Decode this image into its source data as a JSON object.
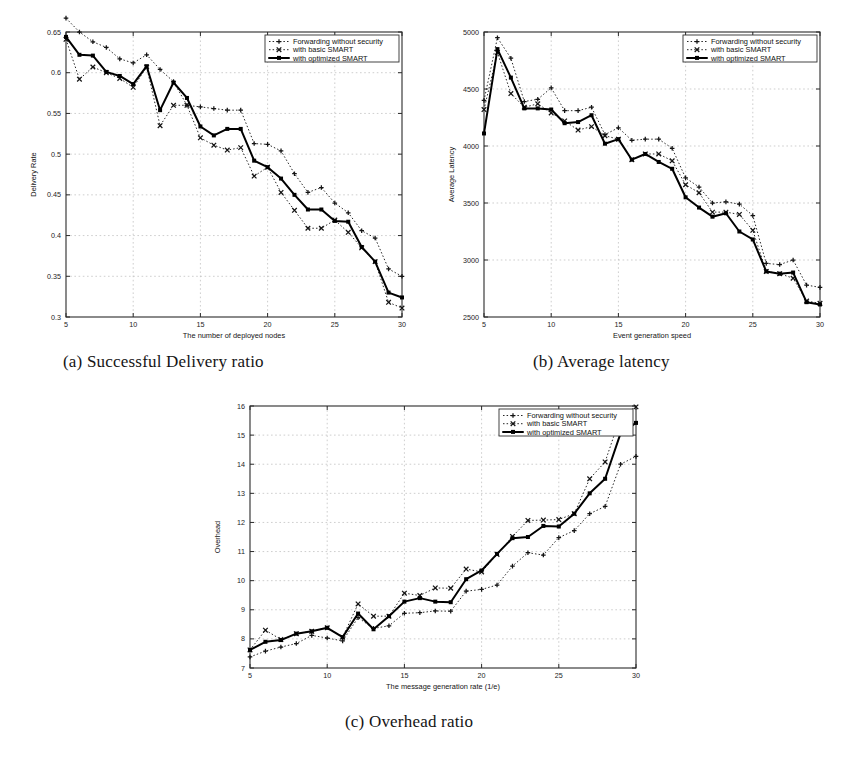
{
  "figure": {
    "background_color": "#ffffff",
    "ink_color": "#141414",
    "subcaptions": {
      "a": "(a) Successful Delivery ratio",
      "b": "(b) Average latency",
      "c": "(c) Overhead ratio"
    }
  },
  "legend": {
    "position": "top-right",
    "entries": [
      {
        "label": "Forwarding without security",
        "marker": "plus",
        "style": "dotted"
      },
      {
        "label": "with basic SMART",
        "marker": "x",
        "style": "dotted"
      },
      {
        "label": "with optimized SMART",
        "marker": "square",
        "style": "solid"
      }
    ]
  },
  "chart_data": [
    {
      "id": "a",
      "type": "line",
      "title": "",
      "xlabel": "The number of deployed nodes",
      "ylabel": "Delivery Rate",
      "xlim": [
        5,
        30
      ],
      "ylim": [
        0.3,
        0.65
      ],
      "xticks": [
        5,
        10,
        15,
        20,
        25,
        30
      ],
      "yticks": [
        0.3,
        0.35,
        0.4,
        0.45,
        0.5,
        0.55,
        0.6,
        0.65
      ],
      "ytick_labels": [
        "0.3",
        "0.35",
        "0.4",
        "0.45",
        "0.5",
        "0.55",
        "0.6",
        "0.65"
      ],
      "xtick_labels": [
        "5",
        "10",
        "15",
        "20",
        "25",
        "30"
      ],
      "grid": true,
      "legend_position": "top-right",
      "x": [
        5,
        6,
        7,
        8,
        9,
        10,
        11,
        12,
        13,
        14,
        15,
        16,
        17,
        18,
        19,
        20,
        21,
        22,
        23,
        24,
        25,
        26,
        27,
        28,
        29,
        30
      ],
      "series": [
        {
          "name": "Forwarding without security",
          "marker": "plus",
          "style": "dotted",
          "values": [
            0.667,
            0.65,
            0.638,
            0.631,
            0.617,
            0.612,
            0.622,
            0.604,
            0.589,
            0.56,
            0.558,
            0.556,
            0.554,
            0.554,
            0.513,
            0.512,
            0.504,
            0.476,
            0.453,
            0.459,
            0.44,
            0.428,
            0.406,
            0.397,
            0.359,
            0.35
          ]
        },
        {
          "name": "with basic SMART",
          "marker": "x",
          "style": "dotted",
          "values": [
            0.641,
            0.592,
            0.607,
            0.6,
            0.593,
            0.582,
            0.607,
            0.535,
            0.56,
            0.56,
            0.52,
            0.511,
            0.505,
            0.508,
            0.473,
            0.484,
            0.453,
            0.431,
            0.409,
            0.409,
            0.419,
            0.404,
            0.385,
            0.368,
            0.318,
            0.311
          ]
        },
        {
          "name": "with optimized SMART",
          "marker": "square",
          "style": "solid",
          "values": [
            0.644,
            0.622,
            0.621,
            0.601,
            0.596,
            0.586,
            0.608,
            0.554,
            0.588,
            0.569,
            0.534,
            0.523,
            0.531,
            0.531,
            0.492,
            0.484,
            0.47,
            0.45,
            0.432,
            0.432,
            0.418,
            0.417,
            0.386,
            0.368,
            0.33,
            0.324
          ]
        }
      ]
    },
    {
      "id": "b",
      "type": "line",
      "title": "",
      "xlabel": "Event generation speed",
      "ylabel": "Average Latency",
      "xlim": [
        5,
        30
      ],
      "ylim": [
        2500,
        5000
      ],
      "xticks": [
        5,
        10,
        15,
        20,
        25,
        30
      ],
      "yticks": [
        2500,
        3000,
        3500,
        4000,
        4500,
        5000
      ],
      "ytick_labels": [
        "2500",
        "3000",
        "3500",
        "4000",
        "4500",
        "5000"
      ],
      "xtick_labels": [
        "5",
        "10",
        "15",
        "20",
        "25",
        "30"
      ],
      "grid": true,
      "legend_position": "top-right",
      "x": [
        5,
        6,
        7,
        8,
        9,
        10,
        11,
        12,
        13,
        14,
        15,
        16,
        17,
        18,
        19,
        20,
        21,
        22,
        23,
        24,
        25,
        26,
        27,
        28,
        29,
        30
      ],
      "series": [
        {
          "name": "Forwarding without security",
          "marker": "plus",
          "style": "dotted",
          "values": [
            4400,
            4950,
            4770,
            4390,
            4410,
            4510,
            4310,
            4310,
            4340,
            4100,
            4160,
            4050,
            4060,
            4060,
            3980,
            3720,
            3640,
            3500,
            3510,
            3490,
            3390,
            2970,
            2960,
            3000,
            2780,
            2760
          ]
        },
        {
          "name": "with basic SMART",
          "marker": "x",
          "style": "dotted",
          "values": [
            4320,
            4820,
            4460,
            4340,
            4370,
            4290,
            4220,
            4140,
            4170,
            4090,
            4060,
            3880,
            3930,
            3930,
            3870,
            3660,
            3590,
            3420,
            3420,
            3400,
            3260,
            2900,
            2880,
            2840,
            2640,
            2620
          ]
        },
        {
          "name": "with optimized SMART",
          "marker": "square",
          "style": "solid",
          "values": [
            4110,
            4850,
            4600,
            4330,
            4330,
            4320,
            4200,
            4210,
            4270,
            4020,
            4060,
            3880,
            3930,
            3860,
            3800,
            3550,
            3460,
            3380,
            3410,
            3250,
            3180,
            2900,
            2880,
            2890,
            2630,
            2610
          ]
        }
      ]
    },
    {
      "id": "c",
      "type": "line",
      "title": "",
      "xlabel": "The message generation rate (1/e)",
      "ylabel": "Overhead",
      "xlim": [
        5,
        30
      ],
      "ylim": [
        7,
        16
      ],
      "xticks": [
        5,
        10,
        15,
        20,
        25,
        30
      ],
      "yticks": [
        7,
        8,
        9,
        10,
        11,
        12,
        13,
        14,
        15,
        16
      ],
      "ytick_labels": [
        "7",
        "8",
        "9",
        "10",
        "11",
        "12",
        "13",
        "14",
        "15",
        "16"
      ],
      "xtick_labels": [
        "5",
        "10",
        "15",
        "20",
        "25",
        "30"
      ],
      "grid": true,
      "legend_position": "top-right",
      "x": [
        5,
        6,
        7,
        8,
        9,
        10,
        11,
        12,
        13,
        14,
        15,
        16,
        17,
        18,
        19,
        20,
        21,
        22,
        23,
        24,
        25,
        26,
        27,
        28,
        29,
        30
      ],
      "series": [
        {
          "name": "Forwarding without security",
          "marker": "plus",
          "style": "dotted",
          "values": [
            7.38,
            7.58,
            7.72,
            7.84,
            8.12,
            8.03,
            7.93,
            8.73,
            8.36,
            8.45,
            8.88,
            8.9,
            8.96,
            8.95,
            9.64,
            9.7,
            9.85,
            10.5,
            10.96,
            10.88,
            11.48,
            11.72,
            12.3,
            12.55,
            14.0,
            14.27
          ]
        },
        {
          "name": "with basic SMART",
          "marker": "x",
          "style": "dotted",
          "values": [
            7.62,
            8.3,
            7.98,
            8.18,
            8.26,
            8.38,
            8.06,
            9.2,
            8.78,
            8.78,
            9.57,
            9.49,
            9.75,
            9.74,
            10.4,
            10.3,
            10.9,
            11.52,
            12.07,
            12.08,
            12.1,
            12.3,
            13.5,
            14.08,
            15.65,
            15.97
          ]
        },
        {
          "name": "with optimized SMART",
          "marker": "square",
          "style": "solid",
          "values": [
            7.62,
            7.9,
            7.96,
            8.18,
            8.26,
            8.38,
            8.06,
            8.87,
            8.33,
            8.78,
            9.28,
            9.4,
            9.28,
            9.26,
            10.05,
            10.35,
            10.92,
            11.46,
            11.5,
            11.88,
            11.86,
            12.3,
            13.0,
            13.5,
            15.06,
            15.42
          ]
        }
      ]
    }
  ]
}
